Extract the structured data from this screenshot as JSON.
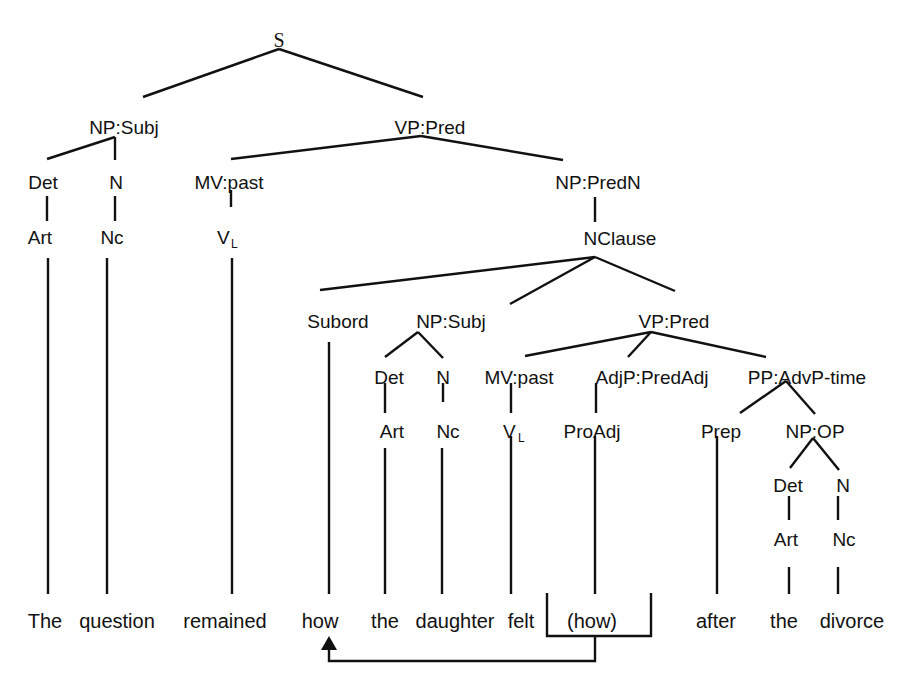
{
  "diagram": {
    "type": "syntax-tree",
    "sentence": "The question remained how the daughter felt (how) after the divorce",
    "colors": {
      "ink": "#111111",
      "background": "#ffffff"
    },
    "nodes": {
      "s": "S",
      "np_subj": "NP:Subj",
      "vp_pred": "VP:Pred",
      "det1": "Det",
      "n1": "N",
      "mv_past1": "MV:past",
      "np_predn": "NP:PredN",
      "art1": "Art",
      "nc1": "Nc",
      "vl1_main": "V",
      "vl1_sub": "L",
      "nclause": "NClause",
      "subord": "Subord",
      "np_subj2": "NP:Subj",
      "vp_pred2": "VP:Pred",
      "det2": "Det",
      "n2": "N",
      "mv_past2": "MV:past",
      "adjp_predadj": "AdjP:PredAdj",
      "pp_advp_time": "PP:AdvP-time",
      "art2": "Art",
      "nc2": "Nc",
      "vl2_main": "V",
      "vl2_sub": "L",
      "proadj": "ProAdj",
      "prep": "Prep",
      "np_op": "NP:OP",
      "det3": "Det",
      "n3": "N",
      "art3": "Art",
      "nc3": "Nc"
    },
    "words": {
      "w1": "The",
      "w2": "question",
      "w3": "remained",
      "w4": "how",
      "w5": "the",
      "w6": "daughter",
      "w7": "felt",
      "w8": "(how)",
      "w9": "after",
      "w10": "the",
      "w11": "divorce"
    },
    "movement_arrow": {
      "from": "(how)",
      "to": "how"
    }
  }
}
